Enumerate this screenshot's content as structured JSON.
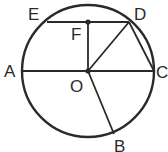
{
  "diagram": {
    "type": "geometry-circle",
    "colors": {
      "line": "#2a2a2a",
      "background": "#ffffff"
    },
    "circle": {
      "center": "O",
      "cx": 88,
      "cy": 71,
      "r": 66
    },
    "points": {
      "O": {
        "label": "O",
        "x": 88,
        "y": 71
      },
      "A": {
        "label": "A",
        "x": 22,
        "y": 71
      },
      "C": {
        "label": "C",
        "x": 154,
        "y": 71
      },
      "E": {
        "label": "E",
        "x": 47,
        "y": 22
      },
      "D": {
        "label": "D",
        "x": 129,
        "y": 22
      },
      "F": {
        "label": "F",
        "x": 88,
        "y": 22
      },
      "B": {
        "label": "B",
        "x": 114,
        "y": 134
      }
    },
    "segments": [
      "AC",
      "ED",
      "FO",
      "OD",
      "DC",
      "OB"
    ],
    "dots": [
      "O",
      "F"
    ]
  }
}
